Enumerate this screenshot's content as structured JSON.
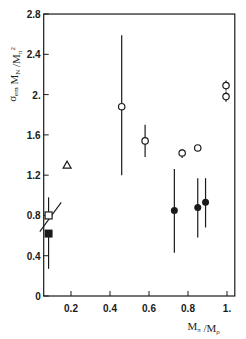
{
  "chart_data": {
    "type": "scatter",
    "title": "",
    "xlabel": "M_π / M_ρ",
    "ylabel": "σ_em M_N / M_π²",
    "xlim": [
      0.06,
      1.04
    ],
    "ylim": [
      0,
      2.8
    ],
    "grid": false,
    "legend": null,
    "x_ticks": [
      {
        "value": 0.2,
        "label": "0.2"
      },
      {
        "value": 0.4,
        "label": "0.4"
      },
      {
        "value": 0.6,
        "label": "0.6"
      },
      {
        "value": 0.8,
        "label": "0.8"
      },
      {
        "value": 1.0,
        "label": "1."
      }
    ],
    "y_ticks": [
      {
        "value": 0,
        "label": "0"
      },
      {
        "value": 0.4,
        "label": "0.4"
      },
      {
        "value": 0.8,
        "label": "0.8"
      },
      {
        "value": 1.2,
        "label": "1.2"
      },
      {
        "value": 1.6,
        "label": "1.6"
      },
      {
        "value": 2.0,
        "label": "2."
      },
      {
        "value": 2.4,
        "label": "2.4"
      },
      {
        "value": 2.8,
        "label": "2.8"
      }
    ],
    "series": [
      {
        "name": "open circles",
        "marker": "open-circle",
        "points": [
          {
            "x": 0.46,
            "y": 1.88,
            "ylo": 1.2,
            "yhi": 2.59
          },
          {
            "x": 0.58,
            "y": 1.54,
            "ylo": 1.38,
            "yhi": 1.7
          },
          {
            "x": 0.77,
            "y": 1.42,
            "ylo": 1.37,
            "yhi": 1.46
          },
          {
            "x": 0.85,
            "y": 1.47,
            "ylo": 1.47,
            "yhi": 1.47
          },
          {
            "x": 0.995,
            "y": 2.09,
            "ylo": 2.04,
            "yhi": 2.14
          },
          {
            "x": 0.995,
            "y": 1.98,
            "ylo": 1.93,
            "yhi": 2.03
          }
        ]
      },
      {
        "name": "filled circles",
        "marker": "filled-circle",
        "points": [
          {
            "x": 0.73,
            "y": 0.85,
            "ylo": 0.43,
            "yhi": 1.26
          },
          {
            "x": 0.85,
            "y": 0.88,
            "ylo": 0.58,
            "yhi": 1.17
          },
          {
            "x": 0.89,
            "y": 0.93,
            "ylo": 0.68,
            "yhi": 1.17
          }
        ]
      },
      {
        "name": "open triangle",
        "marker": "open-triangle",
        "points": [
          {
            "x": 0.18,
            "y": 1.3
          }
        ]
      },
      {
        "name": "open square",
        "marker": "open-square",
        "points": [
          {
            "x": 0.085,
            "y": 0.8,
            "ylo": 0.8,
            "yhi": 0.98
          }
        ]
      },
      {
        "name": "filled square",
        "marker": "filled-square",
        "points": [
          {
            "x": 0.085,
            "y": 0.62,
            "ylo": 0.27,
            "yhi": 0.62
          }
        ]
      }
    ],
    "annotations": [
      {
        "type": "slanted-line",
        "x1": 0.04,
        "y1": 0.64,
        "x2": 0.15,
        "y2": 0.93
      }
    ]
  }
}
